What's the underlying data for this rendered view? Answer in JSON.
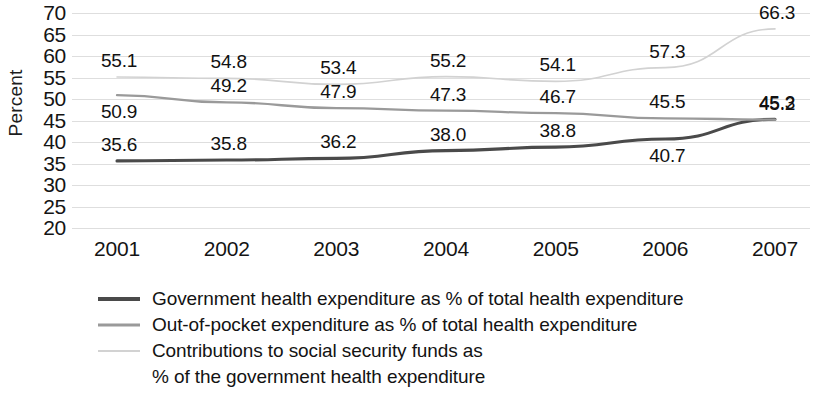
{
  "chart_data": {
    "type": "line",
    "title": "",
    "xlabel": "",
    "ylabel": "Percent",
    "categories": [
      "2001",
      "2002",
      "2003",
      "2004",
      "2005",
      "2006",
      "2007"
    ],
    "ylim": [
      20,
      70
    ],
    "y_ticks": [
      70,
      65,
      60,
      55,
      50,
      45,
      40,
      35,
      30,
      25,
      20
    ],
    "grid": true,
    "legend_position": "bottom-left",
    "series": [
      {
        "name": "Government  health expenditure as % of total health expenditure",
        "short_name": "government-health-expenditure",
        "color": "#4a4a4a",
        "values": [
          35.6,
          35.8,
          36.2,
          38.0,
          38.8,
          40.7,
          45.3
        ],
        "labels": [
          "35.6",
          "35.8",
          "36.2",
          "38.0",
          "38.8",
          "40.7",
          "45.3"
        ]
      },
      {
        "name": "Out-of-pocket expenditure as % of total health expenditure",
        "short_name": "out-of-pocket-expenditure",
        "color": "#9a9a9a",
        "values": [
          50.9,
          49.2,
          47.9,
          47.3,
          46.7,
          45.5,
          45.2
        ],
        "labels": [
          "50.9",
          "49.2",
          "47.9",
          "47.3",
          "46.7",
          "45.5",
          "45.2"
        ]
      },
      {
        "name": "Contributions to social security funds as % of the government health expenditure",
        "short_name": "social-security-contributions",
        "color": "#d2d2d2",
        "values": [
          55.1,
          54.8,
          53.4,
          55.2,
          54.1,
          57.3,
          66.3
        ],
        "labels": [
          "55.1",
          "54.8",
          "53.4",
          "55.2",
          "54.1",
          "57.3",
          "66.3"
        ]
      }
    ]
  },
  "axis": {
    "y_title": "Percent",
    "y_tick_labels": [
      "70",
      "65",
      "60",
      "55",
      "50",
      "45",
      "40",
      "35",
      "30",
      "25",
      "20"
    ],
    "x_tick_labels": [
      "2001",
      "2002",
      "2003",
      "2004",
      "2005",
      "2006",
      "2007"
    ]
  },
  "legend": {
    "entries": [
      {
        "label": "Government  health expenditure as % of total health expenditure",
        "swatch": "solid-dark-line"
      },
      {
        "label": "Out-of-pocket expenditure as % of total health expenditure",
        "swatch": "solid-gray-line"
      },
      {
        "label": "Contributions to social security funds as",
        "swatch": "solid-lightgray-line"
      },
      {
        "label": "% of the government health expenditure",
        "swatch": "none"
      }
    ]
  },
  "point_labels": {
    "series_0": [
      "35.6",
      "35.8",
      "36.2",
      "38.0",
      "38.8",
      "40.7",
      "45.3"
    ],
    "series_1": [
      "50.9",
      "49.2",
      "47.9",
      "47.3",
      "46.7",
      "45.5",
      "45.2"
    ],
    "series_2": [
      "55.1",
      "54.8",
      "53.4",
      "55.2",
      "54.1",
      "57.3",
      "66.3"
    ]
  }
}
